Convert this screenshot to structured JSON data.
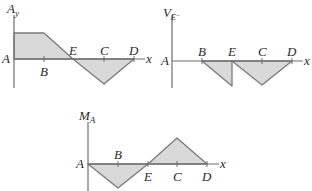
{
  "diagrams": [
    {
      "id": "Ay",
      "y_label": "A",
      "y_sub": "y",
      "x_label": "x",
      "origin_label": "A",
      "points": [
        {
          "label": "B",
          "pos": "below"
        },
        {
          "label": "E",
          "pos": "above"
        },
        {
          "label": "C",
          "pos": "above"
        },
        {
          "label": "D",
          "pos": "above"
        }
      ],
      "shape": "constant positive A→B, linear down crossing zero at E, negative minimum at C, back to zero at D"
    },
    {
      "id": "VE-",
      "y_label": "V",
      "y_sub": "E⁻",
      "x_label": "x",
      "origin_label": "A",
      "points": [
        {
          "label": "B",
          "pos": "above"
        },
        {
          "label": "E",
          "pos": "above"
        },
        {
          "label": "C",
          "pos": "above"
        },
        {
          "label": "D",
          "pos": "above"
        }
      ],
      "shape": "zero A→B, linear negative to E, jump back to zero at E, negative triangle with minimum at C, zero at D"
    },
    {
      "id": "MA",
      "y_label": "M",
      "y_sub": "A",
      "x_label": "x",
      "origin_label": "A",
      "points": [
        {
          "label": "B",
          "pos": "above"
        },
        {
          "label": "E",
          "pos": "below"
        },
        {
          "label": "C",
          "pos": "below"
        },
        {
          "label": "D",
          "pos": "below"
        }
      ],
      "shape": "negative triangle with minimum at B crossing zero at E, positive triangle with maximum at C, zero at D"
    }
  ],
  "colors": {
    "fill": "#d9d9d9",
    "line": "#7a7a7a",
    "text": "#2a2a2a"
  }
}
